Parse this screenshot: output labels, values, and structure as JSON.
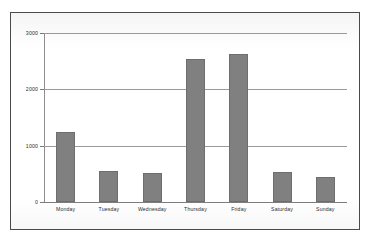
{
  "chart_data": {
    "type": "bar",
    "title": "",
    "subtitle": "",
    "xlabel": "",
    "ylabel": "",
    "categories": [
      "Monday",
      "Tuesday",
      "Wednesday",
      "Thursday",
      "Friday",
      "Saturday",
      "Sunday"
    ],
    "values": [
      1240,
      550,
      515,
      2540,
      2630,
      535,
      445
    ],
    "ylim": [
      0,
      3000
    ],
    "ytick_labels": [
      "0",
      "1000",
      "2000",
      "3000"
    ],
    "ytick_values": [
      0,
      1000,
      2000,
      3000
    ],
    "grid": true,
    "legend": false,
    "legend_position": "none",
    "series": [
      {
        "name": "Visits",
        "values": [
          1240,
          550,
          515,
          2540,
          2630,
          535,
          445
        ]
      }
    ],
    "colors": {
      "bar_fill": "#808080",
      "bar_stroke": "#6e6e6e",
      "gridline": "#9a9a9a",
      "axis": "#8e8e8e",
      "frame_border": "#4a4a4a",
      "background": "#ffffff",
      "tick_text": "#2e2e2e"
    }
  }
}
